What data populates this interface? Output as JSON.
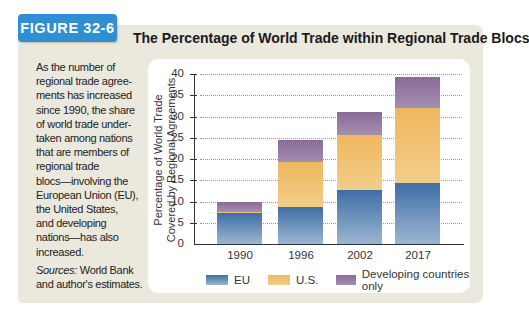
{
  "figure_label": "FIGURE 32-6",
  "caption": {
    "text": "As the number of regional trade agreements has increased since 1990, the share of world trade undertaken among nations that are members of regional trade blocs—involving the European Union (EU), the United States, and developing nations—has also increased.",
    "lines": [
      "As the number of",
      "regional trade agree-",
      "ments has increased",
      "since 1990, the share",
      "of world trade under-",
      "taken among nations",
      "that are members of",
      "regional trade",
      "blocs—involving the",
      "European Union (EU),",
      "the United States,",
      "and developing",
      "nations—has also",
      "increased."
    ],
    "sources_label": "Sources:",
    "sources_line1": " World Bank",
    "sources_line2": "and author's estimates."
  },
  "colors": {
    "badge": "#2f8fd0",
    "panel": "#ebe8dd",
    "eu": "#4a78ae",
    "us": "#f0bd66",
    "dev": "#8d6f9b"
  },
  "chart_data": {
    "type": "bar",
    "stacked": true,
    "title": "The Percentage of World Trade within Regional Trade Blocs",
    "xlabel": "",
    "ylabel": "Percentage of World Trade Covered by Regional Agreements",
    "ylabel_lines": [
      "Percentage of World Trade",
      "Covered by Regional Agreements"
    ],
    "categories": [
      "1990",
      "1996",
      "2002",
      "2017"
    ],
    "series": [
      {
        "name": "EU",
        "values": [
          7.2,
          8.8,
          12.6,
          14.3
        ]
      },
      {
        "name": "U.S.",
        "values": [
          0.4,
          10.5,
          13.1,
          17.8
        ]
      },
      {
        "name": "Developing countries only",
        "values": [
          2.4,
          5.2,
          5.3,
          7.2
        ]
      }
    ],
    "totals": [
      10.0,
      24.5,
      31.0,
      39.3
    ],
    "yticks": [
      0,
      5,
      10,
      15,
      20,
      25,
      30,
      35,
      40
    ],
    "ylim": [
      0,
      40
    ],
    "grid": true,
    "grid_style": "dotted",
    "legend_position": "bottom"
  }
}
